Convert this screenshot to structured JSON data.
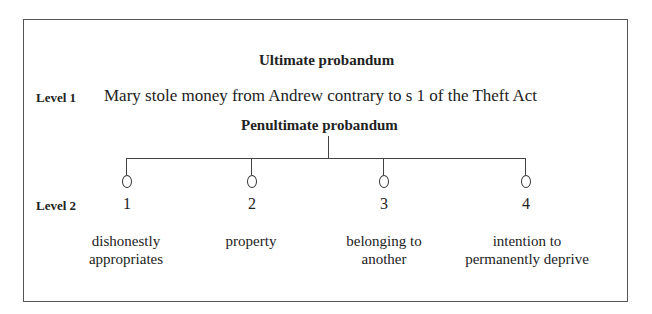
{
  "diagram": {
    "ultimate_title": "Ultimate probandum",
    "level1_label": "Level 1",
    "level1_text": "Mary stole money from Andrew contrary to s 1 of the Theft Act",
    "penultimate_title": "Penultimate probandum",
    "level2_label": "Level 2",
    "elements": [
      {
        "number": "1",
        "label_line1": "dishonestly",
        "label_line2": "appropriates"
      },
      {
        "number": "2",
        "label_line1": "property",
        "label_line2": ""
      },
      {
        "number": "3",
        "label_line1": "belonging to",
        "label_line2": "another"
      },
      {
        "number": "4",
        "label_line1": "intention to",
        "label_line2": "permanently deprive"
      }
    ]
  }
}
